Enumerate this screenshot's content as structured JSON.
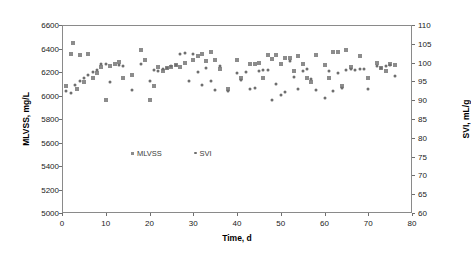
{
  "chart_data": {
    "type": "scatter",
    "title": "",
    "xlabel": "Time, d",
    "ylabel": "MLVSS, mg/L",
    "y2label": "SVI, mL/g",
    "xlim": [
      0,
      80
    ],
    "xticks": [
      0,
      10,
      20,
      30,
      40,
      50,
      60,
      70,
      80
    ],
    "ylim": [
      5000,
      6600
    ],
    "yticks": [
      5000,
      5200,
      5400,
      5600,
      5800,
      6000,
      6200,
      6400,
      6600
    ],
    "y2lim": [
      60,
      110
    ],
    "y2ticks": [
      60,
      65,
      70,
      75,
      80,
      85,
      90,
      95,
      100,
      105,
      110
    ],
    "grid": false,
    "legend_position": "center",
    "series": [
      {
        "name": "MLVSS",
        "axis": "left",
        "marker": "square",
        "color": "#8c8c8c",
        "points": [
          [
            1,
            6080
          ],
          [
            2,
            6350
          ],
          [
            2.6,
            6448
          ],
          [
            3.4,
            6055
          ],
          [
            4,
            6345
          ],
          [
            5,
            6115
          ],
          [
            6,
            6355
          ],
          [
            7,
            6152
          ],
          [
            8,
            6195
          ],
          [
            9,
            6243
          ],
          [
            10,
            5958
          ],
          [
            11,
            6254
          ],
          [
            12,
            6272
          ],
          [
            13,
            6285
          ],
          [
            14,
            6150
          ],
          [
            16,
            6175
          ],
          [
            18,
            6388
          ],
          [
            19,
            6300
          ],
          [
            20,
            5958
          ],
          [
            21,
            6082
          ],
          [
            22,
            6245
          ],
          [
            23,
            6210
          ],
          [
            24,
            6232
          ],
          [
            25,
            6240
          ],
          [
            26,
            6258
          ],
          [
            27,
            6240
          ],
          [
            28,
            6278
          ],
          [
            30,
            6300
          ],
          [
            31,
            6340
          ],
          [
            32,
            6352
          ],
          [
            33,
            6295
          ],
          [
            34,
            6372
          ],
          [
            35,
            6302
          ],
          [
            36,
            6228
          ],
          [
            38,
            6058
          ],
          [
            40,
            6302
          ],
          [
            41,
            6150
          ],
          [
            43,
            6270
          ],
          [
            44,
            6265
          ],
          [
            45,
            6278
          ],
          [
            46,
            6152
          ],
          [
            47,
            6345
          ],
          [
            48,
            6310
          ],
          [
            49,
            6345
          ],
          [
            50,
            6268
          ],
          [
            51,
            6315
          ],
          [
            52,
            6320
          ],
          [
            53,
            6212
          ],
          [
            54,
            6340
          ],
          [
            55,
            6272
          ],
          [
            56,
            6150
          ],
          [
            57,
            6118
          ],
          [
            58,
            6342
          ],
          [
            60,
            6262
          ],
          [
            61,
            6150
          ],
          [
            62,
            6366
          ],
          [
            63,
            6372
          ],
          [
            64,
            6080
          ],
          [
            65,
            6390
          ],
          [
            66,
            6240
          ],
          [
            68,
            6335
          ],
          [
            70,
            6150
          ],
          [
            72,
            6280
          ],
          [
            73,
            6232
          ],
          [
            74,
            6212
          ],
          [
            75,
            6272
          ],
          [
            76,
            6260
          ]
        ]
      },
      {
        "name": "SVI",
        "axis": "right",
        "marker": "dot",
        "color": "#6e6e6e",
        "points": [
          [
            1,
            92.5
          ],
          [
            2,
            91.8
          ],
          [
            3,
            94.0
          ],
          [
            4,
            95.0
          ],
          [
            5,
            95.8
          ],
          [
            6,
            96.8
          ],
          [
            7,
            97.5
          ],
          [
            8,
            98.0
          ],
          [
            9,
            99.5
          ],
          [
            10,
            99.6
          ],
          [
            11,
            94.8
          ],
          [
            13,
            99.3
          ],
          [
            14,
            99.0
          ],
          [
            16,
            92.8
          ],
          [
            18,
            99.5
          ],
          [
            20,
            95.0
          ],
          [
            21,
            98.0
          ],
          [
            22,
            97.8
          ],
          [
            23,
            98.3
          ],
          [
            24,
            98.6
          ],
          [
            25,
            99.0
          ],
          [
            26,
            99.3
          ],
          [
            27,
            102.3
          ],
          [
            28,
            102.5
          ],
          [
            29,
            95.0
          ],
          [
            30,
            102.4
          ],
          [
            31,
            97.5
          ],
          [
            32,
            94.0
          ],
          [
            33,
            98.5
          ],
          [
            34,
            95.2
          ],
          [
            35,
            92.8
          ],
          [
            36,
            99.0
          ],
          [
            38,
            92.5
          ],
          [
            40,
            97.3
          ],
          [
            41,
            95.5
          ],
          [
            42,
            97.5
          ],
          [
            43,
            93.0
          ],
          [
            44,
            93.2
          ],
          [
            45,
            97.8
          ],
          [
            46,
            98.0
          ],
          [
            47,
            97.9
          ],
          [
            48,
            90.0
          ],
          [
            49,
            94.3
          ],
          [
            50,
            91.5
          ],
          [
            51,
            92.2
          ],
          [
            52,
            100.4
          ],
          [
            53,
            96.2
          ],
          [
            54,
            93.0
          ],
          [
            55,
            97.8
          ],
          [
            56,
            98.2
          ],
          [
            57,
            95.6
          ],
          [
            58,
            92.8
          ],
          [
            60,
            90.5
          ],
          [
            61,
            97.8
          ],
          [
            62,
            92.5
          ],
          [
            63,
            97.3
          ],
          [
            64,
            93.3
          ],
          [
            65,
            98.0
          ],
          [
            66,
            98.2
          ],
          [
            67,
            98.0
          ],
          [
            68,
            98.3
          ],
          [
            69,
            98.2
          ],
          [
            70,
            93.0
          ],
          [
            72,
            99.0
          ],
          [
            73,
            98.5
          ],
          [
            74,
            99.2
          ],
          [
            75,
            99.3
          ],
          [
            76,
            96.5
          ]
        ]
      }
    ]
  },
  "legend": {
    "entries": [
      {
        "label": "MLVSS",
        "marker": "square-marker"
      },
      {
        "label": "SVI",
        "marker": "dot-marker"
      }
    ]
  }
}
